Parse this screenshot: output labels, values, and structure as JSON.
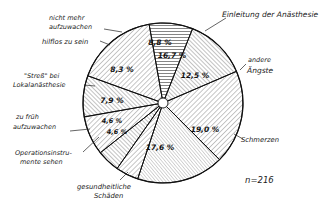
{
  "chart_data": {
    "type": "pie",
    "title": "",
    "n_label": "n=216",
    "start_angle_deg": -10,
    "direction": "clockwise",
    "slices": [
      {
        "label": "Einleitung der Anästhesie",
        "value": 8.8,
        "value_label": "8,8 %",
        "hatch": "horizontal"
      },
      {
        "label": "andere Ängste",
        "value": 12.5,
        "value_label": "12,5 %",
        "hatch": "diag-back"
      },
      {
        "label": "Schmerzen",
        "value": 19.0,
        "value_label": "19,0 %",
        "hatch": "diag-fwd"
      },
      {
        "label": "gesundheitliche Schäden",
        "value": 17.6,
        "value_label": "17,6 %",
        "hatch": "diag-back-fine"
      },
      {
        "label": "Operationsinstrumente sehen",
        "value": 4.6,
        "value_label": "4,6 %",
        "hatch": "diag-fwd"
      },
      {
        "label": "zu früh aufzuwachen",
        "value": 4.6,
        "value_label": "4,6 %",
        "hatch": "diag-back"
      },
      {
        "label": "\"Streß\" bei Lokalanästhesie",
        "value": 7.9,
        "value_label": "7,9 %",
        "hatch": "diag-fwd"
      },
      {
        "label": "hilflos zu sein",
        "value": 8.3,
        "value_label": "8,3 %",
        "hatch": "diag-back"
      },
      {
        "label": "nicht mehr aufzuwachen",
        "value": 16.7,
        "value_label": "16,7 %",
        "hatch": "diag-fwd"
      }
    ],
    "legend": "none (labels outside with leader lines)"
  },
  "labels": {
    "einleitung": [
      "Einleitung der Anästhesie"
    ],
    "andere": [
      "andere",
      "Ängste"
    ],
    "schmerzen": [
      "Schmerzen"
    ],
    "schaeden": [
      "gesundheitliche",
      "Schäden"
    ],
    "op": [
      "Operationsinstru-",
      "mente sehen"
    ],
    "frueh": [
      "zu früh",
      "aufzuwachen"
    ],
    "stress": [
      "\"Streß\" bei",
      "Lokalanästhesie"
    ],
    "hilflos": [
      "hilflos zu sein"
    ],
    "nicht": [
      "nicht mehr",
      "aufzuwachen"
    ]
  }
}
